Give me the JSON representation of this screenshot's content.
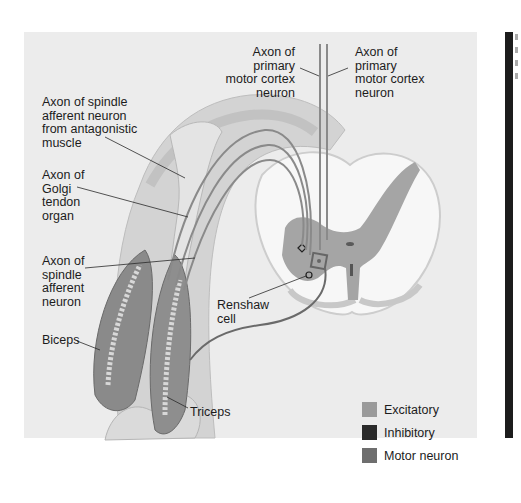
{
  "diagram": {
    "labels": {
      "spindle_antagonist": "Axon of spindle\nafferent neuron\nfrom antagonistic\nmuscle",
      "golgi": "Axon of\nGolgi\ntendon\norgan",
      "spindle_afferent": "Axon of\nspindle\nafferent\nneuron",
      "biceps": "Biceps",
      "triceps": "Triceps",
      "renshaw": "Renshaw\ncell",
      "motor_cortex_left": "Axon of\nprimary\nmotor cortex\nneuron",
      "motor_cortex_right": "Axon of\nprimary\nmotor cortex\nneuron"
    },
    "legend": [
      {
        "label": "Excitatory",
        "color": "#9a9a9a"
      },
      {
        "label": "Inhibitory",
        "color": "#2a2a2a"
      },
      {
        "label": "Motor neuron",
        "color": "#6e6e6e"
      }
    ]
  }
}
